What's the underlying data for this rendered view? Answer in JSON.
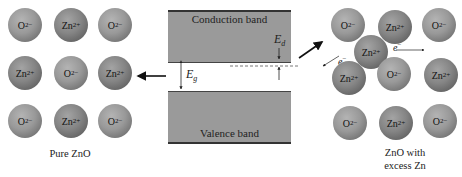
{
  "left_panel": {
    "caption": "Pure ZnO",
    "ions": [
      {
        "type": "o",
        "base": "O",
        "charge": "2−",
        "x": 8,
        "y": 8
      },
      {
        "type": "zn",
        "base": "Zn",
        "charge": "2+",
        "x": 54,
        "y": 8
      },
      {
        "type": "o",
        "base": "O",
        "charge": "2−",
        "x": 98,
        "y": 8
      },
      {
        "type": "zn",
        "base": "Zn",
        "charge": "2+",
        "x": 8,
        "y": 56
      },
      {
        "type": "o",
        "base": "O",
        "charge": "2−",
        "x": 54,
        "y": 56
      },
      {
        "type": "zn",
        "base": "Zn",
        "charge": "2+",
        "x": 98,
        "y": 56
      },
      {
        "type": "o",
        "base": "O",
        "charge": "2−",
        "x": 8,
        "y": 104
      },
      {
        "type": "zn",
        "base": "Zn",
        "charge": "2+",
        "x": 54,
        "y": 104
      },
      {
        "type": "o",
        "base": "O",
        "charge": "2−",
        "x": 98,
        "y": 104
      }
    ]
  },
  "band_diagram": {
    "conduction_band_label": "Conduction band",
    "valence_band_label": "Valence band",
    "gap_symbol": "E",
    "gap_subscript": "g",
    "donor_symbol": "E",
    "donor_subscript": "d"
  },
  "right_panel": {
    "caption_line1": "ZnO with",
    "caption_line2": "excess Zn",
    "electron_symbol": "e",
    "electron_charge": "−",
    "ions": [
      {
        "type": "o",
        "base": "O",
        "charge": "2−",
        "x": 331,
        "y": 8
      },
      {
        "type": "zn",
        "base": "Zn",
        "charge": "2+",
        "x": 378,
        "y": 10
      },
      {
        "type": "o",
        "base": "O",
        "charge": "2−",
        "x": 422,
        "y": 8
      },
      {
        "type": "zn",
        "base": "Zn",
        "charge": "2+",
        "x": 354,
        "y": 35
      },
      {
        "type": "zn",
        "base": "Zn",
        "charge": "2+",
        "x": 332,
        "y": 61
      },
      {
        "type": "o",
        "base": "O",
        "charge": "2−",
        "x": 377,
        "y": 57
      },
      {
        "type": "zn",
        "base": "Zn",
        "charge": "2+",
        "x": 424,
        "y": 58
      },
      {
        "type": "o",
        "base": "O",
        "charge": "2−",
        "x": 333,
        "y": 106
      },
      {
        "type": "zn",
        "base": "Zn",
        "charge": "2+",
        "x": 379,
        "y": 106
      },
      {
        "type": "o",
        "base": "O",
        "charge": "2−",
        "x": 423,
        "y": 104
      }
    ]
  }
}
